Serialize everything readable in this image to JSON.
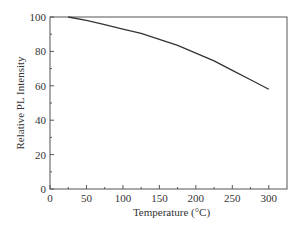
{
  "chart_data": {
    "type": "line",
    "title": "",
    "xlabel": "Temperature (°C)",
    "ylabel": "Relative PL Intensity",
    "xlim": [
      0,
      325
    ],
    "ylim": [
      0,
      100
    ],
    "xticks": [
      0,
      50,
      100,
      150,
      200,
      250,
      300
    ],
    "yticks": [
      0,
      20,
      40,
      60,
      80,
      100
    ],
    "grid": false,
    "legend": null,
    "series": [
      {
        "name": "Relative PL Intensity",
        "color": "#333333",
        "x": [
          25,
          50,
          75,
          100,
          125,
          150,
          175,
          200,
          225,
          250,
          275,
          300
        ],
        "y": [
          100,
          98,
          95.5,
          93,
          90.5,
          87,
          83.5,
          79,
          74.5,
          69,
          63.5,
          58
        ]
      }
    ]
  }
}
